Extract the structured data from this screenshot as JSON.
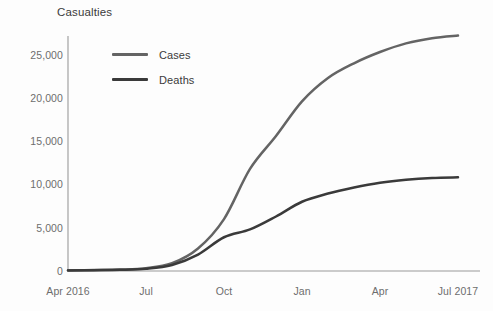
{
  "chart_data": {
    "type": "line",
    "title": "Casualties",
    "xlabel": "",
    "ylabel": "",
    "grid": false,
    "legend_position": "upper-left-inside",
    "ylim": [
      0,
      27500
    ],
    "yticks": [
      0,
      5000,
      10000,
      15000,
      20000,
      25000
    ],
    "ytick_labels": [
      "0",
      "5,000",
      "10,000",
      "15,000",
      "20,000",
      "25,000"
    ],
    "x": [
      "Apr 2016",
      "May 2016",
      "Jun 2016",
      "Jul 2016",
      "Aug 2016",
      "Sep 2016",
      "Oct 2016",
      "Nov 2016",
      "Dec 2016",
      "Jan 2017",
      "Feb 2017",
      "Mar 2017",
      "Apr 2017",
      "May 2017",
      "Jun 2017",
      "Jul 2017"
    ],
    "xtick_labels": [
      "Apr 2016",
      "Jul",
      "Oct",
      "Jan",
      "Apr",
      "Jul 2017"
    ],
    "xtick_x": [
      "Apr 2016",
      "Jul 2016",
      "Oct 2016",
      "Jan 2017",
      "Apr 2017",
      "Jul 2017"
    ],
    "series": [
      {
        "name": "Cases",
        "color": "#646464",
        "values": [
          80,
          110,
          160,
          320,
          900,
          2600,
          6000,
          11800,
          15600,
          19600,
          22300,
          24000,
          25300,
          26300,
          26900,
          27200
        ]
      },
      {
        "name": "Deaths",
        "color": "#3a3a3a",
        "values": [
          70,
          95,
          135,
          260,
          700,
          1900,
          3900,
          4800,
          6300,
          8000,
          8950,
          9650,
          10200,
          10550,
          10750,
          10820
        ]
      }
    ],
    "axis_color": "#9a9a9a",
    "text_color": "#6d6d6d",
    "title_color": "#3b3b3b",
    "background": "#fdfdfd"
  }
}
